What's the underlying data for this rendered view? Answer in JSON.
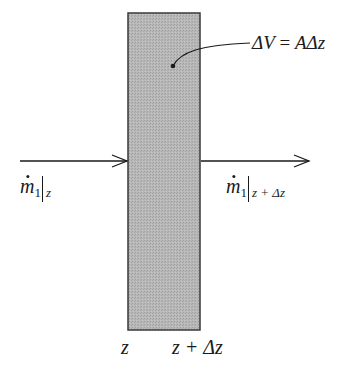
{
  "diagram": {
    "type": "control-volume mass balance",
    "colors": {
      "slab_fill": "#b4b4b4",
      "slab_border": "#3a3a3a",
      "line": "#1a1a1a",
      "background": "#ffffff"
    },
    "volume_label": {
      "lhs": "ΔV",
      "eq": "=",
      "rhs": "AΔz"
    },
    "inflow_label": {
      "symbol": "m",
      "subscript": "1",
      "evaluated_at": "z"
    },
    "outflow_label": {
      "symbol": "m",
      "subscript": "1",
      "evaluated_at": "z + Δz"
    },
    "axis_labels": {
      "left_face": "z",
      "right_face": "z + Δz"
    }
  }
}
